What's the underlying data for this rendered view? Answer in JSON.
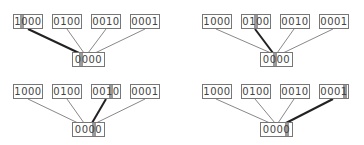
{
  "diagram": {
    "top_nodes": [
      "1000",
      "0100",
      "0010",
      "0001"
    ],
    "bottom_node": "0000",
    "panels": [
      {
        "highlight_index": 0,
        "top": [
          "1000",
          "0100",
          "0010",
          "0001"
        ],
        "bottom": "0000"
      },
      {
        "highlight_index": 1,
        "top": [
          "1000",
          "0100",
          "0010",
          "0001"
        ],
        "bottom": "0000"
      },
      {
        "highlight_index": 2,
        "top": [
          "1000",
          "0100",
          "0010",
          "0001"
        ],
        "bottom": "0000"
      },
      {
        "highlight_index": 3,
        "top": [
          "1000",
          "0100",
          "0010",
          "0001"
        ],
        "bottom": "0000"
      }
    ],
    "colors": {
      "line": "#888888",
      "highlight_line": "#222222",
      "highlight_bit": "#999999",
      "border": "#777777"
    }
  }
}
